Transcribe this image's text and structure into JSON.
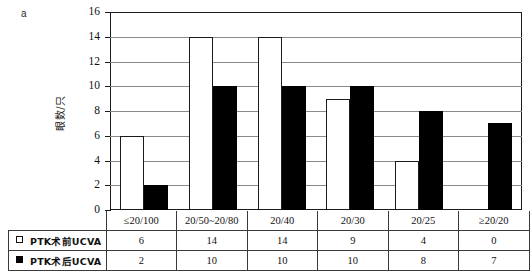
{
  "panel_label": "a",
  "chart_data": {
    "type": "bar",
    "title": "",
    "xlabel": "",
    "ylabel": "眼数/只",
    "ylim": [
      0,
      16
    ],
    "ytick_step": 2,
    "yticks": [
      "0",
      "2",
      "4",
      "6",
      "8",
      "10",
      "12",
      "14",
      "16"
    ],
    "grid": true,
    "grid_axis": "y",
    "legend_position": "table-left",
    "categories": [
      "≤20/100",
      "20/50~20/80",
      "20/40",
      "20/30",
      "20/25",
      "≥20/20"
    ],
    "series": [
      {
        "name": "PTK术前UCVA",
        "swatch": "open-square",
        "color": "#ffffff",
        "edge_color": "#1b1b1b",
        "values": [
          6,
          14,
          14,
          9,
          4,
          0
        ]
      },
      {
        "name": "PTK术后UCVA",
        "swatch": "filled-square",
        "color": "#000000",
        "edge_color": "#000000",
        "values": [
          2,
          10,
          10,
          10,
          8,
          7
        ]
      }
    ]
  },
  "table": {
    "row_labels": [
      "PTK术前UCVA",
      "PTK术后UCVA"
    ],
    "category_row": [
      "≤20/100",
      "20/50~20/80",
      "20/40",
      "20/30",
      "20/25",
      "≥20/20"
    ],
    "rows": [
      [
        "6",
        "14",
        "14",
        "9",
        "4",
        "0"
      ],
      [
        "2",
        "10",
        "10",
        "10",
        "8",
        "7"
      ]
    ]
  },
  "colors": {
    "frame": "#1b1b1b",
    "gridline": "#8a8a8a",
    "pre_bar": "#ffffff",
    "post_bar": "#000000",
    "background": "#ffffff"
  }
}
